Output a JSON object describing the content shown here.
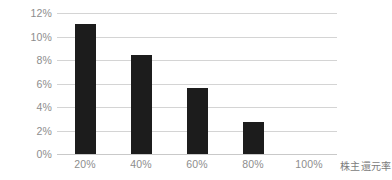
{
  "chart_data": {
    "type": "bar",
    "title": "",
    "subtitle": "",
    "xlabel": "株主還元率",
    "ylabel": "",
    "categories": [
      "20%",
      "40%",
      "60%",
      "80%",
      "100%"
    ],
    "values": [
      11.1,
      8.4,
      5.6,
      2.7,
      0
    ],
    "value_unit": "%",
    "ylim": [
      0,
      12
    ],
    "ytick_labels": [
      "12%",
      "10%",
      "8%",
      "6%",
      "4%",
      "2%",
      "0%"
    ],
    "ytick_values": [
      12,
      10,
      8,
      6,
      4,
      2,
      0
    ],
    "ytick_step": 2,
    "grid": "horizontal",
    "legend": "none",
    "series": [
      {
        "name": "",
        "values": [
          11.1,
          8.4,
          5.6,
          2.7,
          0
        ]
      }
    ],
    "annotations": [],
    "colors": {
      "bar": "#1c1c1c",
      "gridline": "#d4d4d4",
      "axis_line": "#c9c9c9",
      "tick_label": "#8d8d8d",
      "axis_title": "#7c7c7c",
      "background": "#ffffff"
    }
  }
}
